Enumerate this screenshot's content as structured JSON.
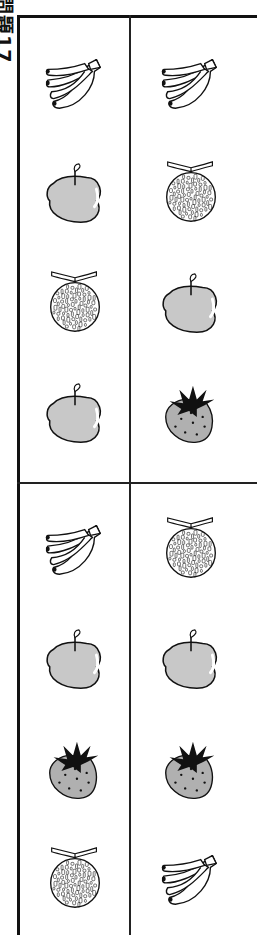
{
  "title": "問題17",
  "fruit_legend": {
    "banana": "banana-icon",
    "apple": "apple-icon",
    "melon": "melon-icon",
    "strawberry": "strawberry-icon"
  },
  "colors": {
    "line": "#111111",
    "apple_fill": "#c8c8c8",
    "strawberry_fill": "#b0b0b0",
    "leaf": "#111111"
  },
  "panels": [
    {
      "columns": [
        {
          "items": [
            "banana",
            "apple",
            "melon",
            "apple"
          ]
        },
        {
          "items": [
            "banana",
            "melon",
            "apple",
            "strawberry"
          ]
        }
      ]
    },
    {
      "columns": [
        {
          "items": [
            "banana",
            "apple",
            "strawberry",
            "melon"
          ]
        },
        {
          "items": [
            "melon",
            "apple",
            "strawberry",
            "banana"
          ]
        }
      ]
    }
  ]
}
